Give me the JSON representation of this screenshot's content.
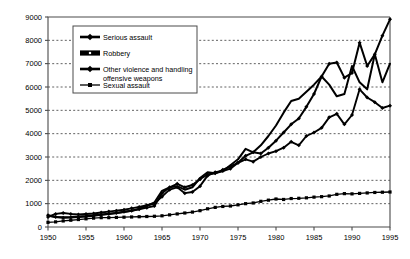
{
  "chart_data": {
    "type": "line",
    "title": "",
    "subtitle": "",
    "xlabel": "",
    "ylabel": "",
    "xlim": [
      1950,
      1995
    ],
    "ylim": [
      0,
      9000
    ],
    "grid": true,
    "grid_axis": "y",
    "legend_position": "top-left-inside",
    "x_ticks": [
      "1950",
      "1955",
      "1960",
      "1965",
      "1970",
      "1975",
      "1980",
      "1985",
      "1990",
      "1995"
    ],
    "y_ticks": [
      "0",
      "1000",
      "2000",
      "3000",
      "4000",
      "5000",
      "6000",
      "7000",
      "8000",
      "9000"
    ],
    "x": [
      1950,
      1951,
      1952,
      1953,
      1954,
      1955,
      1956,
      1957,
      1958,
      1959,
      1960,
      1961,
      1962,
      1963,
      1964,
      1965,
      1966,
      1967,
      1968,
      1969,
      1970,
      1971,
      1972,
      1973,
      1974,
      1975,
      1976,
      1977,
      1978,
      1979,
      1980,
      1981,
      1982,
      1983,
      1984,
      1985,
      1986,
      1987,
      1988,
      1989,
      1990,
      1991,
      1992,
      1993,
      1994,
      1995
    ],
    "series": [
      {
        "name": "Serious assault",
        "marker": "diamond",
        "values": [
          500,
          430,
          400,
          410,
          430,
          450,
          480,
          520,
          560,
          600,
          650,
          700,
          760,
          830,
          900,
          1450,
          1700,
          1850,
          1700,
          1800,
          2050,
          2250,
          2300,
          2450,
          2600,
          2750,
          3050,
          3200,
          3150,
          3400,
          3700,
          4050,
          4400,
          4650,
          5150,
          5700,
          6450,
          7000,
          7050,
          6400,
          6600,
          7900,
          6900,
          7400,
          8200,
          8900
        ]
      },
      {
        "name": "Robbery",
        "marker": "none",
        "values": [
          480,
          430,
          420,
          430,
          450,
          470,
          500,
          540,
          570,
          600,
          640,
          700,
          780,
          900,
          1050,
          1550,
          1700,
          1750,
          1600,
          1700,
          2100,
          2350,
          2300,
          2400,
          2650,
          2900,
          3350,
          3200,
          3500,
          3900,
          4350,
          4900,
          5400,
          5500,
          5800,
          6100,
          6450,
          6100,
          5600,
          5700,
          6900,
          6200,
          5900,
          7400,
          6200,
          7000
        ]
      },
      {
        "name": "Other violence and handling offensive weapons",
        "marker": "diamond",
        "values": [
          430,
          560,
          600,
          560,
          540,
          560,
          580,
          620,
          660,
          700,
          740,
          800,
          860,
          930,
          1000,
          1300,
          1600,
          1700,
          1450,
          1500,
          1750,
          2200,
          2350,
          2400,
          2500,
          2750,
          2900,
          2800,
          3000,
          3150,
          3250,
          3400,
          3650,
          3500,
          3900,
          4050,
          4250,
          4700,
          4850,
          4400,
          4800,
          5900,
          5550,
          5350,
          5100,
          5200
        ]
      },
      {
        "name": "Sexual assault",
        "marker": "square",
        "values": [
          200,
          220,
          260,
          290,
          320,
          350,
          380,
          400,
          400,
          410,
          420,
          430,
          440,
          450,
          460,
          480,
          520,
          560,
          600,
          640,
          700,
          780,
          840,
          880,
          900,
          950,
          1000,
          1030,
          1100,
          1150,
          1200,
          1180,
          1220,
          1230,
          1250,
          1280,
          1300,
          1330,
          1400,
          1430,
          1420,
          1440,
          1460,
          1480,
          1490,
          1500
        ]
      }
    ],
    "legend": [
      {
        "label": "Serious assault",
        "marker": "diamond"
      },
      {
        "label": "Robbery",
        "marker": "bar"
      },
      {
        "label": "Other violence and handling",
        "label2": "offensive weapons",
        "marker": "diamond"
      },
      {
        "label": "Sexual assault",
        "marker": "square"
      }
    ],
    "colors": {
      "series": "#000000",
      "axis": "#4a4a4a",
      "grid": "#3a3a3a",
      "background": "#ffffff"
    }
  }
}
